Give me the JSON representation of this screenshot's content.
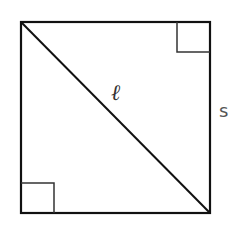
{
  "diagram": {
    "type": "square-with-diagonal",
    "labels": {
      "diagonal": "ℓ",
      "side": "s"
    },
    "right_angle_markers": [
      "top-right",
      "bottom-left"
    ],
    "colors": {
      "stroke": "#111111",
      "marker_stroke": "#333333",
      "label_diagonal": "#333333",
      "label_side": "#555555",
      "background": "#ffffff"
    }
  }
}
